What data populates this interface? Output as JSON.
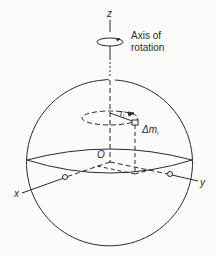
{
  "diagram": {
    "type": "rotating-sphere",
    "labels": {
      "z_axis": "z",
      "x_axis": "x",
      "y_axis": "y",
      "origin": "O",
      "axis_caption_line1": "Axis of",
      "axis_caption_line2": "rotation",
      "radius": "r",
      "radius_sub": "i",
      "mass": "Δm",
      "mass_sub": "i"
    },
    "colors": {
      "line": "#2a2a2a",
      "background": "#fbfbf9"
    }
  }
}
